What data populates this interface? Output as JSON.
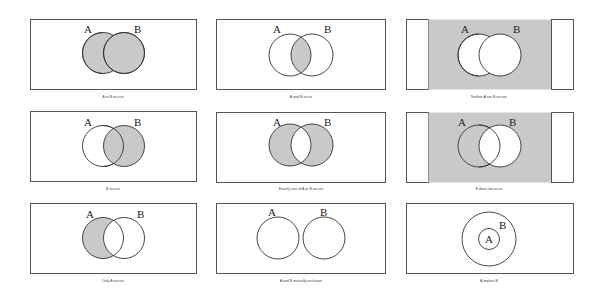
{
  "colors": {
    "shade": "#c9c9c9",
    "stroke": "#333333",
    "frame": "#555555",
    "background": "#ffffff"
  },
  "labels": {
    "a": "A",
    "b": "B"
  },
  "panels": [
    {
      "id": "a-or-b",
      "caption": "A or B occurs"
    },
    {
      "id": "a-and-b",
      "caption": "A and B occur"
    },
    {
      "id": "neither",
      "caption": "Neither A nor B occurs"
    },
    {
      "id": "b-occurs",
      "caption": "B occurs"
    },
    {
      "id": "exactly-one",
      "caption": "Exactly one of A or B occurs"
    },
    {
      "id": "b-not",
      "caption": "B does not occur"
    },
    {
      "id": "only-a",
      "caption": "Only A occurs"
    },
    {
      "id": "mutually-exclusive",
      "caption": "A and B mutually exclusive"
    },
    {
      "id": "a-implies-b",
      "caption": "A implies B"
    }
  ]
}
